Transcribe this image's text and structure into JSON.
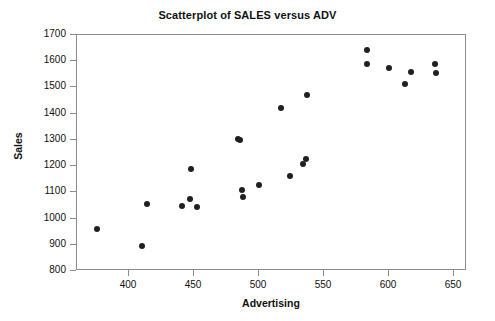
{
  "chart_data": {
    "type": "scatter",
    "title": "Scatterplot of SALES versus ADV",
    "xlabel": "Advertising",
    "ylabel": "Sales",
    "xlim": [
      360,
      660
    ],
    "ylim": [
      800,
      1700
    ],
    "xticks": [
      400,
      450,
      500,
      550,
      600,
      650
    ],
    "yticks": [
      800,
      900,
      1000,
      1100,
      1200,
      1300,
      1400,
      1500,
      1600,
      1700
    ],
    "grid": false,
    "legend": null,
    "marker": "filled-circle",
    "marker_color": "#231f20",
    "series": [
      {
        "name": "SALES vs ADV",
        "x": [
          375,
          410,
          414,
          441,
          447,
          452,
          448,
          484,
          485,
          487,
          488,
          500,
          517,
          524,
          534,
          536,
          537,
          583,
          583,
          600,
          612,
          617,
          635,
          636
        ],
        "y": [
          962,
          896,
          1056,
          1048,
          1074,
          1043,
          1188,
          1302,
          1298,
          1110,
          1082,
          1129,
          1422,
          1163,
          1207,
          1229,
          1470,
          1641,
          1591,
          1573,
          1514,
          1560,
          1591,
          1557
        ]
      }
    ]
  },
  "axes": {
    "x_tick_labels": [
      "400",
      "450",
      "500",
      "550",
      "600",
      "650"
    ],
    "y_tick_labels": [
      "1700",
      "1600",
      "1500",
      "1400",
      "1300",
      "1200",
      "1100",
      "1000",
      "900",
      "800"
    ]
  },
  "colors": {
    "marker": "#231f20",
    "frame": "#8c8c8c",
    "background": "#ffffff",
    "text": "#111111"
  }
}
